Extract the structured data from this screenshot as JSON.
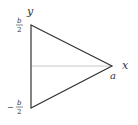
{
  "diagram": {
    "type": "triangle-coordinate-figure",
    "axes": {
      "y_label": "y",
      "x_label": "x"
    },
    "vertices": {
      "top_label_num": "b",
      "top_label_den": "2",
      "bottom_label_sign": "−",
      "bottom_label_num": "b",
      "bottom_label_den": "2",
      "apex_label": "a"
    },
    "colors": {
      "edge": "#333333",
      "axis": "#c8c8c8",
      "text": "#333333"
    }
  }
}
